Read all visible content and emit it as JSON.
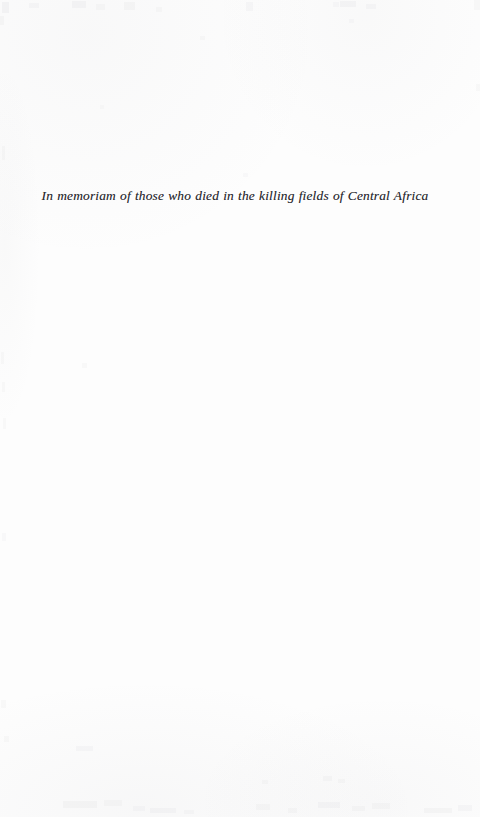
{
  "page": {
    "kind": "book-dedication-page",
    "background_color": "#fdfdfd",
    "ink_color": "#2b2b30",
    "width": 480,
    "height": 817
  },
  "dedication": {
    "text": "In memoriam of those who died in the killing fields of Central Africa"
  }
}
